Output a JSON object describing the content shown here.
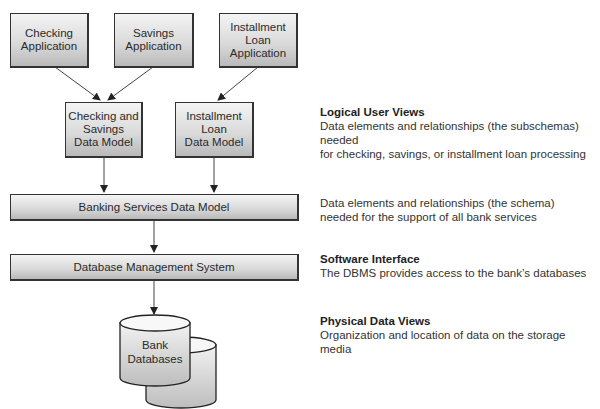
{
  "diagram": {
    "applications": [
      {
        "label": "Checking\nApplication"
      },
      {
        "label": "Savings\nApplication"
      },
      {
        "label": "Installment\nLoan\nApplication"
      }
    ],
    "data_models": [
      {
        "label": "Checking and\nSavings\nData Model"
      },
      {
        "label": "Installment\nLoan\nData Model"
      }
    ],
    "banking_services": {
      "label": "Banking Services Data Model"
    },
    "dbms": {
      "label": "Database Management System"
    },
    "databases": {
      "label": "Bank\nDatabases"
    }
  },
  "descriptions": [
    {
      "title": "Logical User Views",
      "lines": [
        "Data elements and relationships (the subschemas) needed",
        "for checking, savings, or installment loan processing"
      ]
    },
    {
      "title": "",
      "lines": [
        "Data elements and relationships (the schema)",
        "needed for the support of all bank services"
      ]
    },
    {
      "title": "Software Interface",
      "lines": [
        "The DBMS provides access to the bank’s databases"
      ]
    },
    {
      "title": "Physical Data Views",
      "lines": [
        "Organization and location of data on the storage media"
      ]
    }
  ],
  "colors": {
    "line": "#333333",
    "box_top": "#f4f4f4",
    "box_bottom": "#b9b9b9"
  }
}
